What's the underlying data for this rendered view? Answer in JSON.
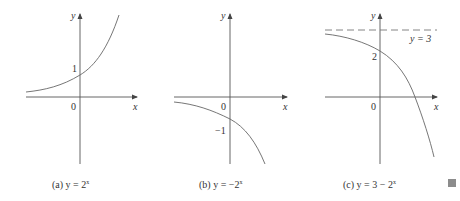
{
  "figure": {
    "panels": [
      {
        "id": "a",
        "caption_prefix": "(a) y = 2",
        "caption_exp": "x",
        "y_axis_label": "y",
        "x_axis_label": "x",
        "origin_label": "0",
        "tick_label": "1",
        "function": "y = 2^x"
      },
      {
        "id": "b",
        "caption_prefix": "(b) y = −2",
        "caption_exp": "x",
        "y_axis_label": "y",
        "x_axis_label": "x",
        "origin_label": "0",
        "tick_label": "−1",
        "function": "y = -2^x"
      },
      {
        "id": "c",
        "caption_prefix": "(c) y = 3 − 2",
        "caption_exp": "x",
        "y_axis_label": "y",
        "x_axis_label": "x",
        "origin_label": "0",
        "tick_label": "2",
        "asymptote_label": "y = 3",
        "function": "y = 3 - 2^x"
      }
    ],
    "end_mark_color": "#8c8c8c"
  }
}
